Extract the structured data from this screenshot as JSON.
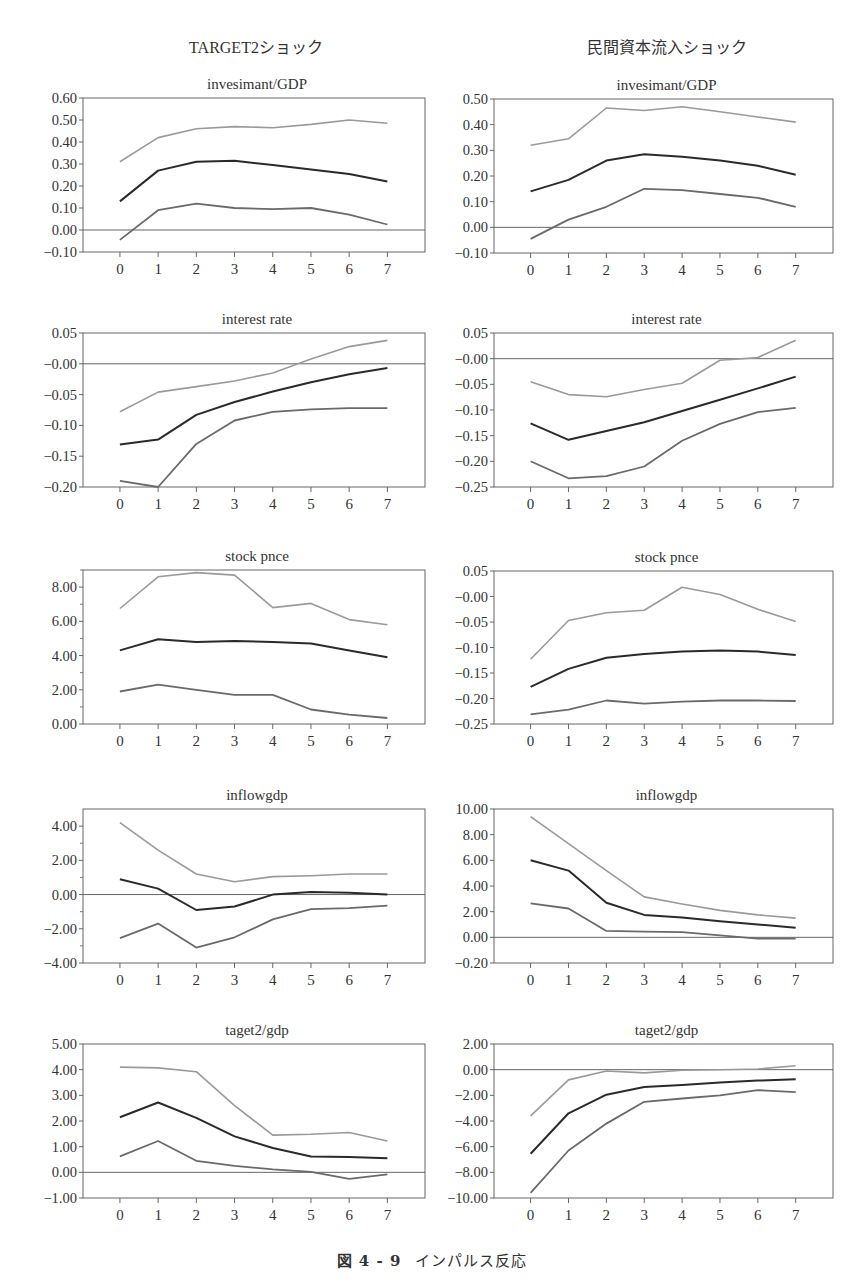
{
  "figure": {
    "caption_number": "図 4 - 9",
    "caption_text": "インパルス反応",
    "column_headers": [
      "TARGET2ショック",
      "民間資本流入ショック"
    ],
    "line_colors": {
      "upper": "#9a9a9a",
      "response": "#2a2a2a",
      "lower": "#6a6a6a"
    }
  },
  "chart_data": [
    {
      "id": "t2-invest",
      "column": 0,
      "row": 0,
      "type": "line",
      "header": "TARGET2ショック",
      "title": "invesimant/GDP",
      "frame": [
        83,
        98,
        425,
        252
      ],
      "ylim": [
        -0.1,
        0.6
      ],
      "yticks": [
        0.6,
        0.5,
        0.4,
        0.3,
        0.2,
        0.1,
        0.0,
        -0.1
      ],
      "ytick_labels": [
        "0.60",
        "0.50",
        "0.40",
        "0.30",
        "0.20",
        "0.10",
        "0.00",
        "−0.10"
      ],
      "x": [
        0,
        1,
        2,
        3,
        4,
        5,
        6,
        7
      ],
      "zero_line": true,
      "series": [
        {
          "name": "upper",
          "values": [
            0.31,
            0.42,
            0.46,
            0.47,
            0.465,
            0.48,
            0.5,
            0.485
          ]
        },
        {
          "name": "response",
          "values": [
            0.13,
            0.27,
            0.31,
            0.315,
            0.295,
            0.275,
            0.255,
            0.22
          ]
        },
        {
          "name": "lower",
          "values": [
            -0.045,
            0.09,
            0.12,
            0.1,
            0.095,
            0.1,
            0.07,
            0.025
          ]
        }
      ]
    },
    {
      "id": "pc-invest",
      "column": 1,
      "row": 0,
      "type": "line",
      "header": "民間資本流入ショック",
      "title": "invesimant/GDP",
      "frame": [
        494,
        99,
        833,
        253
      ],
      "ylim": [
        -0.1,
        0.5
      ],
      "yticks": [
        0.5,
        0.4,
        0.3,
        0.2,
        0.1,
        0.0,
        -0.1
      ],
      "ytick_labels": [
        "0.50",
        "0.40",
        "0.30",
        "0.20",
        "0.10",
        "0.00",
        "−0.10"
      ],
      "x": [
        0,
        1,
        2,
        3,
        4,
        5,
        6,
        7
      ],
      "zero_line": true,
      "series": [
        {
          "name": "upper",
          "values": [
            0.32,
            0.345,
            0.465,
            0.455,
            0.47,
            0.45,
            0.43,
            0.41
          ]
        },
        {
          "name": "response",
          "values": [
            0.14,
            0.185,
            0.26,
            0.285,
            0.275,
            0.26,
            0.24,
            0.205
          ]
        },
        {
          "name": "lower",
          "values": [
            -0.045,
            0.03,
            0.08,
            0.15,
            0.145,
            0.13,
            0.115,
            0.08
          ]
        }
      ]
    },
    {
      "id": "t2-rate",
      "column": 0,
      "row": 1,
      "type": "line",
      "title": "interest rate",
      "frame": [
        83,
        333,
        425,
        487
      ],
      "ylim": [
        -0.2,
        0.05
      ],
      "yticks": [
        0.05,
        0.0,
        -0.05,
        -0.1,
        -0.15,
        -0.2
      ],
      "ytick_labels": [
        "0.05",
        "−0.00",
        "−0.05",
        "−0.10",
        "−0.15",
        "−0.20"
      ],
      "x": [
        0,
        1,
        2,
        3,
        4,
        5,
        6,
        7
      ],
      "zero_line": true,
      "series": [
        {
          "name": "upper",
          "values": [
            -0.078,
            -0.046,
            -0.037,
            -0.028,
            -0.015,
            0.008,
            0.028,
            0.038
          ]
        },
        {
          "name": "response",
          "values": [
            -0.131,
            -0.123,
            -0.083,
            -0.062,
            -0.045,
            -0.03,
            -0.017,
            -0.007
          ]
        },
        {
          "name": "lower",
          "values": [
            -0.19,
            -0.2,
            -0.13,
            -0.092,
            -0.078,
            -0.074,
            -0.072,
            -0.072
          ]
        }
      ]
    },
    {
      "id": "pc-rate",
      "column": 1,
      "row": 1,
      "type": "line",
      "title": "interest rate",
      "frame": [
        494,
        333,
        833,
        487
      ],
      "ylim": [
        -0.25,
        0.05
      ],
      "yticks": [
        0.05,
        0.0,
        -0.05,
        -0.1,
        -0.15,
        -0.2,
        -0.25
      ],
      "ytick_labels": [
        "0.05",
        "−0.00",
        "−0.05",
        "−0.10",
        "−0.15",
        "−0.20",
        "−0.25"
      ],
      "x": [
        0,
        1,
        2,
        3,
        4,
        5,
        6,
        7
      ],
      "zero_line": true,
      "series": [
        {
          "name": "upper",
          "values": [
            -0.045,
            -0.07,
            -0.074,
            -0.06,
            -0.048,
            -0.003,
            0.002,
            0.036
          ]
        },
        {
          "name": "response",
          "values": [
            -0.126,
            -0.158,
            -0.141,
            -0.124,
            -0.102,
            -0.08,
            -0.058,
            -0.035
          ]
        },
        {
          "name": "lower",
          "values": [
            -0.2,
            -0.233,
            -0.229,
            -0.21,
            -0.16,
            -0.127,
            -0.104,
            -0.096
          ]
        }
      ]
    },
    {
      "id": "t2-stock",
      "column": 0,
      "row": 2,
      "type": "line",
      "title": "stock pnce",
      "frame": [
        83,
        570,
        425,
        724
      ],
      "ylim": [
        0.0,
        9.0
      ],
      "yticks": [
        8.0,
        6.0,
        4.0,
        2.0,
        0.0
      ],
      "ytick_labels": [
        "8.00",
        "6.00",
        "4.00",
        "2.00",
        "0.00"
      ],
      "minor_yticks": [
        9,
        7,
        5,
        3,
        1
      ],
      "x": [
        0,
        1,
        2,
        3,
        4,
        5,
        6,
        7
      ],
      "zero_line": false,
      "series": [
        {
          "name": "upper",
          "values": [
            6.75,
            8.6,
            8.85,
            8.7,
            6.8,
            7.05,
            6.1,
            5.8
          ]
        },
        {
          "name": "response",
          "values": [
            4.3,
            4.95,
            4.8,
            4.85,
            4.8,
            4.7,
            4.3,
            3.9
          ]
        },
        {
          "name": "lower",
          "values": [
            1.9,
            2.3,
            2.0,
            1.7,
            1.7,
            0.85,
            0.55,
            0.35
          ]
        }
      ]
    },
    {
      "id": "pc-stock",
      "column": 1,
      "row": 2,
      "type": "line",
      "title": "stock pnce",
      "frame": [
        494,
        571,
        833,
        724
      ],
      "ylim": [
        -0.25,
        0.05
      ],
      "yticks": [
        0.05,
        0.0,
        -0.05,
        -0.1,
        -0.15,
        -0.2,
        -0.25
      ],
      "ytick_labels": [
        "0.05",
        "−0.00",
        "−0.05",
        "−0.10",
        "−0.15",
        "−0.20",
        "−0.25"
      ],
      "x": [
        0,
        1,
        2,
        3,
        4,
        5,
        6,
        7
      ],
      "zero_line": false,
      "series": [
        {
          "name": "upper",
          "values": [
            -0.123,
            -0.047,
            -0.032,
            -0.027,
            0.018,
            0.004,
            -0.025,
            -0.049
          ]
        },
        {
          "name": "response",
          "values": [
            -0.177,
            -0.142,
            -0.12,
            -0.113,
            -0.108,
            -0.106,
            -0.108,
            -0.115
          ]
        },
        {
          "name": "lower",
          "values": [
            -0.231,
            -0.222,
            -0.204,
            -0.21,
            -0.206,
            -0.204,
            -0.204,
            -0.205
          ]
        }
      ]
    },
    {
      "id": "t2-inflow",
      "column": 0,
      "row": 3,
      "type": "line",
      "title": "inflowgdp",
      "frame": [
        83,
        809,
        425,
        963
      ],
      "ylim": [
        -4.0,
        5.0
      ],
      "yticks": [
        4.0,
        2.0,
        0.0,
        -2.0,
        -4.0
      ],
      "ytick_labels": [
        "4.00",
        "2.00",
        "0.00",
        "−2.00",
        "−4.00"
      ],
      "minor_yticks": [
        3,
        1,
        -1,
        -3
      ],
      "x": [
        0,
        1,
        2,
        3,
        4,
        5,
        6,
        7
      ],
      "zero_line": true,
      "series": [
        {
          "name": "upper",
          "values": [
            4.2,
            2.6,
            1.2,
            0.75,
            1.05,
            1.1,
            1.2,
            1.2
          ]
        },
        {
          "name": "response",
          "values": [
            0.9,
            0.35,
            -0.9,
            -0.7,
            0.0,
            0.15,
            0.1,
            0.0
          ]
        },
        {
          "name": "lower",
          "values": [
            -2.55,
            -1.7,
            -3.1,
            -2.5,
            -1.45,
            -0.85,
            -0.8,
            -0.65
          ]
        }
      ]
    },
    {
      "id": "pc-inflow",
      "column": 1,
      "row": 3,
      "type": "line",
      "title": "inflowgdp",
      "frame": [
        494,
        809,
        833,
        963
      ],
      "ylim": [
        -2.0,
        10.0
      ],
      "yticks": [
        10.0,
        8.0,
        6.0,
        4.0,
        2.0,
        0.0,
        -2.0
      ],
      "ytick_labels": [
        "10.00",
        "8.00",
        "6.00",
        "4.00",
        "2.00",
        "0.00",
        "−0.20"
      ],
      "x": [
        0,
        1,
        2,
        3,
        4,
        5,
        6,
        7
      ],
      "zero_line": true,
      "series": [
        {
          "name": "upper",
          "values": [
            9.4,
            7.3,
            5.2,
            3.15,
            2.6,
            2.1,
            1.75,
            1.5
          ]
        },
        {
          "name": "response",
          "values": [
            6.0,
            5.2,
            2.7,
            1.75,
            1.55,
            1.25,
            1.0,
            0.75
          ]
        },
        {
          "name": "lower",
          "values": [
            2.65,
            2.25,
            0.5,
            0.45,
            0.4,
            0.15,
            -0.1,
            -0.1
          ]
        }
      ]
    },
    {
      "id": "t2-target",
      "column": 0,
      "row": 4,
      "type": "line",
      "title": "taget2/gdp",
      "frame": [
        83,
        1044,
        425,
        1198
      ],
      "ylim": [
        -1.0,
        5.0
      ],
      "yticks": [
        5.0,
        4.0,
        3.0,
        2.0,
        1.0,
        0.0,
        -1.0
      ],
      "ytick_labels": [
        "5.00",
        "4.00",
        "3.00",
        "2.00",
        "1.00",
        "0.00",
        "−1.00"
      ],
      "x": [
        0,
        1,
        2,
        3,
        4,
        5,
        6,
        7
      ],
      "zero_line": true,
      "series": [
        {
          "name": "upper",
          "values": [
            4.1,
            4.07,
            3.92,
            2.6,
            1.45,
            1.48,
            1.55,
            1.22
          ]
        },
        {
          "name": "response",
          "values": [
            2.15,
            2.72,
            2.12,
            1.4,
            0.95,
            0.62,
            0.6,
            0.55
          ]
        },
        {
          "name": "lower",
          "values": [
            0.62,
            1.22,
            0.45,
            0.25,
            0.12,
            0.02,
            -0.25,
            -0.08
          ]
        }
      ]
    },
    {
      "id": "pc-target",
      "column": 1,
      "row": 4,
      "type": "line",
      "title": "taget2/gdp",
      "frame": [
        494,
        1044,
        833,
        1198
      ],
      "ylim": [
        -10.0,
        2.0
      ],
      "yticks": [
        2.0,
        0.0,
        -2.0,
        -4.0,
        -6.0,
        -8.0,
        -10.0
      ],
      "ytick_labels": [
        "2.00",
        "0.00",
        "−2.00",
        "−4.00",
        "−6.00",
        "−8.00",
        "−10.00"
      ],
      "x": [
        0,
        1,
        2,
        3,
        4,
        5,
        6,
        7
      ],
      "zero_line": true,
      "series": [
        {
          "name": "upper",
          "values": [
            -3.6,
            -0.8,
            -0.1,
            -0.25,
            -0.05,
            0.0,
            0.05,
            0.3
          ]
        },
        {
          "name": "response",
          "values": [
            -6.55,
            -3.4,
            -1.95,
            -1.35,
            -1.2,
            -1.0,
            -0.85,
            -0.75
          ]
        },
        {
          "name": "lower",
          "values": [
            -9.6,
            -6.3,
            -4.2,
            -2.5,
            -2.25,
            -2.0,
            -1.6,
            -1.75
          ]
        }
      ]
    }
  ]
}
